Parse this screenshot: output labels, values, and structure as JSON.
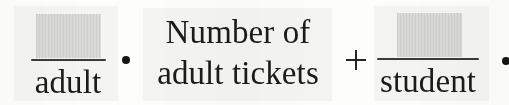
{
  "expression": {
    "description": "Handwritten-math worksheet fragment: blank-over-adult fraction times number of adult tickets plus blank-over-student fraction times (cut off)",
    "terms": [
      {
        "kind": "fraction",
        "numerator_label": "blank-answer-box",
        "numerator_text": "",
        "denominator_text": "adult"
      },
      {
        "kind": "operator",
        "symbol": "·",
        "name": "multiplication-dot"
      },
      {
        "kind": "phrase",
        "lines": [
          "Number of",
          "adult tickets"
        ]
      },
      {
        "kind": "operator",
        "symbol": "+",
        "name": "plus-sign"
      },
      {
        "kind": "fraction",
        "numerator_label": "blank-answer-box",
        "numerator_text": "",
        "denominator_text": "student"
      },
      {
        "kind": "operator",
        "symbol": "·",
        "name": "multiplication-dot-truncated"
      }
    ]
  },
  "colors": {
    "background": "#fdfdfc",
    "panel": "#f4f4f3",
    "ink": "#1b1b1b",
    "rule": "#3a3a3a",
    "blank_box": "#e3e3e2"
  }
}
